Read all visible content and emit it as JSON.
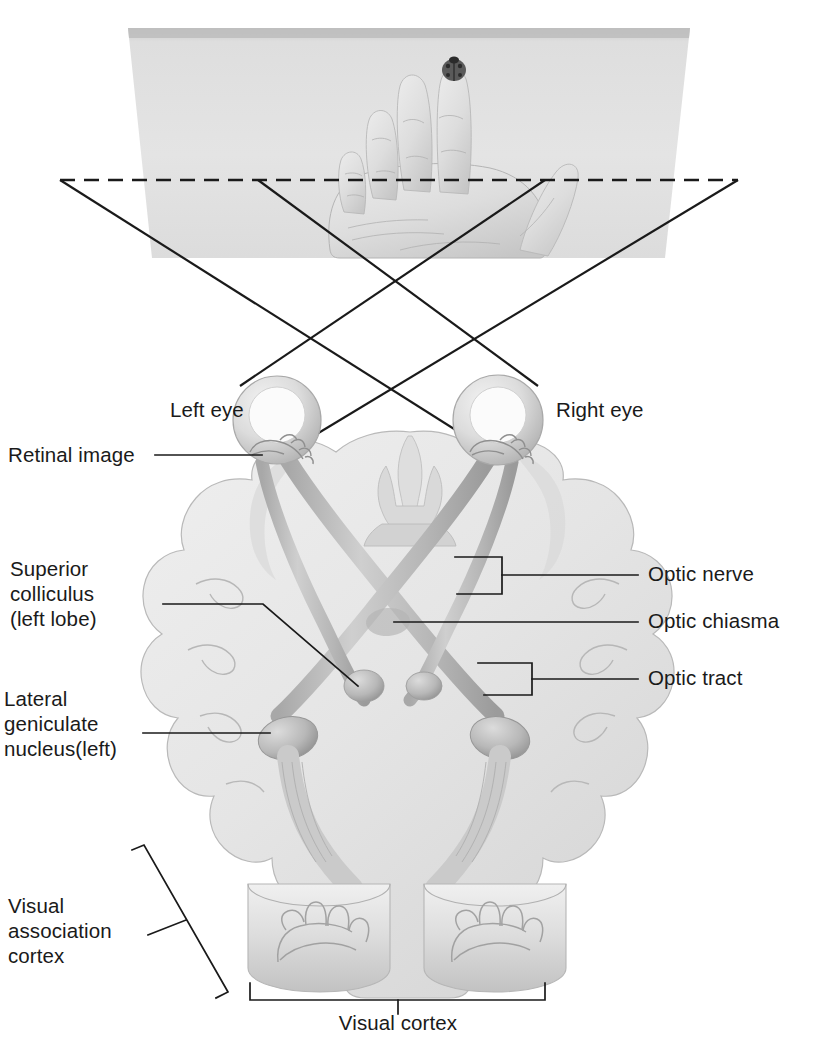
{
  "diagram": {
    "colors": {
      "background": "#ffffff",
      "line": "#1a1a1a",
      "text": "#1a1a1a",
      "stimulus_plane_light": "#e2e2e2",
      "stimulus_plane_dark": "#c9c9c9",
      "brain_fill": "#e8e8e8",
      "brain_shade": "#cfcfcf",
      "tract_fill": "#bdbdbd",
      "tract_shade": "#9a9a9a",
      "eye_fill": "#d8d8d8",
      "ladybug": "#555555"
    }
  },
  "scene": {
    "stimulus": {
      "name": "hand-with-ladybug",
      "description": "Open human hand, palm toward viewer, on a receding rectangular plane; a ladybug rests on the index fingertip",
      "ladybug_on": "index fingertip"
    },
    "horizon_line": {
      "name": "fixation-plane",
      "style": "dashed"
    },
    "rays": {
      "count": 4,
      "description": "Straight light rays from the two ends of the dashed plane crossing into each eye, forming X patterns on the eyes"
    }
  },
  "labels": {
    "left_eye": "Left eye",
    "right_eye": "Right eye",
    "retinal_image": "Retinal image",
    "superior_colliculus": "Superior\ncolliculus\n(left lobe)",
    "superior_colliculus_lines": [
      "Superior",
      "colliculus",
      "(left lobe)"
    ],
    "lateral_geniculate": "Lateral\ngeniculate\nnucleus(left)",
    "lateral_geniculate_lines": [
      "Lateral",
      "geniculate",
      "nucleus(left)"
    ],
    "optic_nerve": "Optic nerve",
    "optic_chiasma": "Optic chiasma",
    "optic_tract": "Optic tract",
    "visual_association_cortex": "Visual\nassociation\ncortex",
    "visual_association_cortex_lines": [
      "Visual",
      "association",
      "cortex"
    ],
    "visual_cortex": "Visual cortex"
  },
  "structures": [
    {
      "id": "left-eye",
      "label": "Left eye",
      "side": "left",
      "callout": "plain-line"
    },
    {
      "id": "right-eye",
      "label": "Right eye",
      "side": "right",
      "callout": "plain-line"
    },
    {
      "id": "retinal-image",
      "label": "Retinal image",
      "side": "left",
      "callout": "plain-line"
    },
    {
      "id": "superior-colliculus",
      "label": "Superior colliculus (left lobe)",
      "side": "left",
      "callout": "elbow-line"
    },
    {
      "id": "lateral-geniculate-nucleus",
      "label": "Lateral geniculate nucleus(left)",
      "side": "left",
      "callout": "plain-line"
    },
    {
      "id": "optic-nerve",
      "label": "Optic nerve",
      "side": "right",
      "callout": "rect-bracket"
    },
    {
      "id": "optic-chiasma",
      "label": "Optic chiasma",
      "side": "right",
      "callout": "plain-line"
    },
    {
      "id": "optic-tract",
      "label": "Optic tract",
      "side": "right",
      "callout": "rect-bracket"
    },
    {
      "id": "visual-association-cortex",
      "label": "Visual association cortex",
      "side": "left",
      "callout": "slanted-bracket"
    },
    {
      "id": "visual-cortex",
      "label": "Visual cortex",
      "side": "bottom",
      "callout": "bottom-bracket"
    }
  ]
}
